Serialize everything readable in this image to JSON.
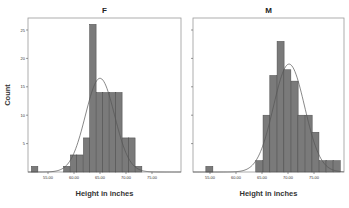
{
  "chart_data": {
    "type": "bar",
    "subtype": "histogram-with-normal-curve",
    "panels": [
      {
        "title": "F",
        "xlabel": "Height in inches",
        "ylabel": "Count",
        "x_ticks": [
          "55.00",
          "60.00",
          "65.00",
          "70.00",
          "75.00"
        ],
        "y_ticks": [
          "5",
          "10",
          "15",
          "20",
          "25"
        ],
        "ylim": [
          0,
          27
        ],
        "bin_width": 1.25,
        "bins": [
          {
            "start": 51.8,
            "count": 1
          },
          {
            "start": 58.0,
            "count": 1
          },
          {
            "start": 59.3,
            "count": 3
          },
          {
            "start": 60.5,
            "count": 3
          },
          {
            "start": 61.8,
            "count": 6
          },
          {
            "start": 63.0,
            "count": 26
          },
          {
            "start": 64.3,
            "count": 14
          },
          {
            "start": 65.5,
            "count": 14
          },
          {
            "start": 66.8,
            "count": 14
          },
          {
            "start": 68.0,
            "count": 14
          },
          {
            "start": 69.3,
            "count": 6
          },
          {
            "start": 70.5,
            "count": 6
          },
          {
            "start": 71.8,
            "count": 1
          }
        ],
        "normal_curve": {
          "mean": 65.0,
          "sd": 2.8,
          "peak_count": 16.5
        }
      },
      {
        "title": "M",
        "xlabel": "Height in inches",
        "ylabel": "",
        "x_ticks": [
          "55.00",
          "60.00",
          "65.00",
          "70.00",
          "75.00"
        ],
        "y_ticks": [
          "",
          "",
          "",
          "",
          ""
        ],
        "ylim": [
          0,
          27
        ],
        "bin_width": 1.35,
        "bins": [
          {
            "start": 54.2,
            "count": 1
          },
          {
            "start": 63.8,
            "count": 2
          },
          {
            "start": 65.2,
            "count": 10
          },
          {
            "start": 66.5,
            "count": 17
          },
          {
            "start": 67.9,
            "count": 23
          },
          {
            "start": 69.2,
            "count": 18
          },
          {
            "start": 70.6,
            "count": 16
          },
          {
            "start": 71.9,
            "count": 10
          },
          {
            "start": 73.3,
            "count": 10
          },
          {
            "start": 74.6,
            "count": 7
          },
          {
            "start": 76.0,
            "count": 2
          },
          {
            "start": 77.3,
            "count": 2
          },
          {
            "start": 78.7,
            "count": 2
          }
        ],
        "normal_curve": {
          "mean": 70.2,
          "sd": 3.0,
          "peak_count": 19
        }
      }
    ],
    "grid": false,
    "legend": "none"
  },
  "colors": {
    "bar_fill": "#7a7a7a",
    "bar_stroke": "#4a4a4a",
    "curve": "#555555",
    "frame": "#999999"
  }
}
